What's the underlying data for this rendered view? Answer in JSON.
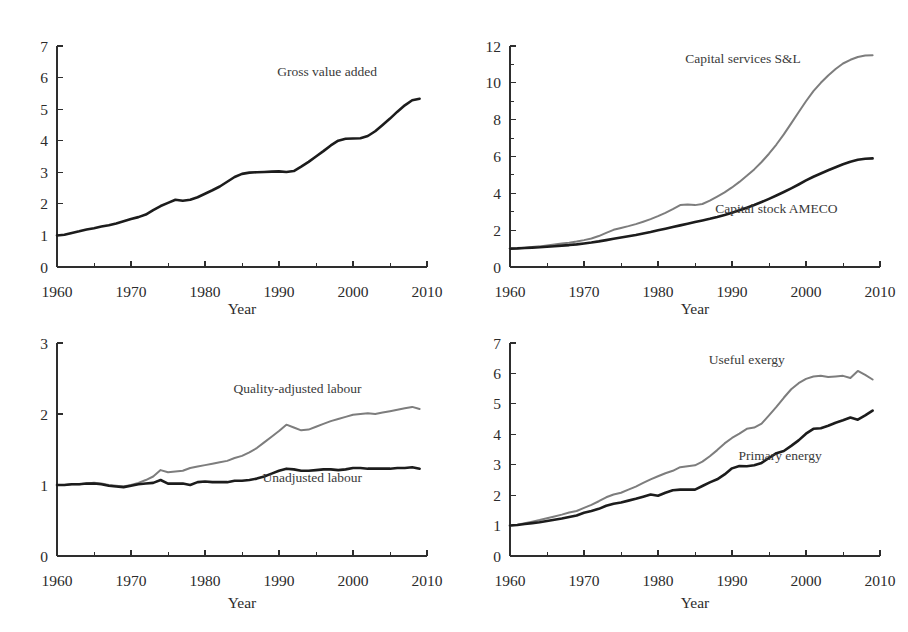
{
  "figure": {
    "title": "",
    "background": "#ffffff",
    "layout": "2x2 grid of line charts",
    "panel_count": 4
  },
  "colors": {
    "dark_series": "#1c1c1c",
    "grey_series": "#7d7d7d",
    "axis": "#2e2e2e",
    "text": "#2b2b2b",
    "background": "#ffffff"
  },
  "chart_data": [
    {
      "id": "panel-top-left",
      "type": "line",
      "title": "",
      "xlabel": "Year",
      "ylabel": "",
      "xlim": [
        1960,
        2010
      ],
      "ylim": [
        0,
        7
      ],
      "xticks": [
        1960,
        1970,
        1980,
        1990,
        2000,
        2010
      ],
      "xticklabels": [
        "1960",
        "1970",
        "1980",
        "1990",
        "2000",
        "2010"
      ],
      "xminorticks": [
        1965,
        1975,
        1985,
        1995,
        2005
      ],
      "yticks": [
        0,
        1,
        2,
        3,
        4,
        5,
        6,
        7
      ],
      "yticklabels": [
        "0",
        "1",
        "2",
        "3",
        "4",
        "5",
        "6",
        "7"
      ],
      "yminorticks": [],
      "grid": false,
      "legend": "inline-annotation",
      "annotations": [
        {
          "text": "Gross value added",
          "x": 1996.5,
          "y": 6.05,
          "anchor": "middle"
        }
      ],
      "series": [
        {
          "name": "Gross value added",
          "color": "#1c1c1c",
          "x": [
            1960,
            1961,
            1962,
            1963,
            1964,
            1965,
            1966,
            1967,
            1968,
            1969,
            1970,
            1971,
            1972,
            1973,
            1974,
            1975,
            1976,
            1977,
            1978,
            1979,
            1980,
            1981,
            1982,
            1983,
            1984,
            1985,
            1986,
            1987,
            1988,
            1989,
            1990,
            1991,
            1992,
            1993,
            1994,
            1995,
            1996,
            1997,
            1998,
            1999,
            2000,
            2001,
            2002,
            2003,
            2004,
            2005,
            2006,
            2007,
            2008,
            2009
          ],
          "values": [
            1.0,
            1.02,
            1.08,
            1.13,
            1.19,
            1.23,
            1.28,
            1.32,
            1.38,
            1.45,
            1.52,
            1.58,
            1.66,
            1.8,
            1.93,
            2.03,
            2.13,
            2.1,
            2.13,
            2.21,
            2.32,
            2.43,
            2.55,
            2.7,
            2.85,
            2.95,
            2.99,
            3.0,
            3.01,
            3.02,
            3.03,
            3.01,
            3.04,
            3.18,
            3.33,
            3.5,
            3.67,
            3.85,
            4.0,
            4.06,
            4.07,
            4.08,
            4.15,
            4.3,
            4.5,
            4.7,
            4.92,
            5.12,
            5.28,
            5.33
          ]
        }
      ]
    },
    {
      "id": "panel-top-right",
      "type": "line",
      "title": "",
      "xlabel": "Year",
      "ylabel": "",
      "xlim": [
        1960,
        2010
      ],
      "ylim": [
        0,
        12
      ],
      "xticks": [
        1960,
        1970,
        1980,
        1990,
        2000,
        2010
      ],
      "xticklabels": [
        "1960",
        "1970",
        "1980",
        "1990",
        "2000",
        "2010"
      ],
      "xminorticks": [
        1965,
        1975,
        1985,
        1995,
        2005
      ],
      "yticks": [
        0,
        2,
        4,
        6,
        8,
        10,
        12
      ],
      "yticklabels": [
        "0",
        "2",
        "4",
        "6",
        "8",
        "10",
        "12"
      ],
      "yminorticks": [
        1,
        3,
        5,
        7,
        9,
        11
      ],
      "grid": false,
      "legend": "inline-annotation",
      "annotations": [
        {
          "text": "Capital services S&L",
          "x": 1991.5,
          "y": 11.1,
          "anchor": "middle"
        },
        {
          "text": "Capital stock AMECO",
          "x": 1996.0,
          "y": 2.95,
          "anchor": "middle"
        }
      ],
      "series": [
        {
          "name": "Capital services S&L",
          "color": "#7d7d7d",
          "x": [
            1960,
            1961,
            1962,
            1963,
            1964,
            1965,
            1966,
            1967,
            1968,
            1969,
            1970,
            1971,
            1972,
            1973,
            1974,
            1975,
            1976,
            1977,
            1978,
            1979,
            1980,
            1981,
            1982,
            1983,
            1984,
            1985,
            1986,
            1987,
            1988,
            1989,
            1990,
            1991,
            1992,
            1993,
            1994,
            1995,
            1996,
            1997,
            1998,
            1999,
            2000,
            2001,
            2002,
            2003,
            2004,
            2005,
            2006,
            2007,
            2008,
            2009
          ],
          "values": [
            1.0,
            1.02,
            1.05,
            1.08,
            1.12,
            1.17,
            1.22,
            1.27,
            1.32,
            1.38,
            1.46,
            1.55,
            1.68,
            1.85,
            2.02,
            2.12,
            2.22,
            2.33,
            2.46,
            2.6,
            2.76,
            2.94,
            3.14,
            3.36,
            3.4,
            3.36,
            3.42,
            3.6,
            3.82,
            4.05,
            4.32,
            4.62,
            4.95,
            5.3,
            5.7,
            6.15,
            6.65,
            7.2,
            7.8,
            8.4,
            9.0,
            9.55,
            10.0,
            10.4,
            10.75,
            11.05,
            11.25,
            11.4,
            11.48,
            11.5
          ]
        },
        {
          "name": "Capital stock AMECO",
          "color": "#1c1c1c",
          "x": [
            1960,
            1961,
            1962,
            1963,
            1964,
            1965,
            1966,
            1967,
            1968,
            1969,
            1970,
            1971,
            1972,
            1973,
            1974,
            1975,
            1976,
            1977,
            1978,
            1979,
            1980,
            1981,
            1982,
            1983,
            1984,
            1985,
            1986,
            1987,
            1988,
            1989,
            1990,
            1991,
            1992,
            1993,
            1994,
            1995,
            1996,
            1997,
            1998,
            1999,
            2000,
            2001,
            2002,
            2003,
            2004,
            2005,
            2006,
            2007,
            2008,
            2009
          ],
          "values": [
            1.0,
            1.01,
            1.03,
            1.05,
            1.07,
            1.1,
            1.13,
            1.16,
            1.19,
            1.23,
            1.28,
            1.33,
            1.39,
            1.46,
            1.53,
            1.6,
            1.67,
            1.74,
            1.82,
            1.9,
            1.99,
            2.08,
            2.17,
            2.26,
            2.35,
            2.44,
            2.53,
            2.62,
            2.72,
            2.83,
            2.95,
            3.08,
            3.22,
            3.37,
            3.53,
            3.7,
            3.88,
            4.07,
            4.27,
            4.48,
            4.7,
            4.9,
            5.08,
            5.25,
            5.42,
            5.58,
            5.72,
            5.82,
            5.88,
            5.9
          ]
        }
      ]
    },
    {
      "id": "panel-bottom-left",
      "type": "line",
      "title": "",
      "xlabel": "Year",
      "ylabel": "",
      "xlim": [
        1960,
        2010
      ],
      "ylim": [
        0,
        3
      ],
      "xticks": [
        1960,
        1970,
        1980,
        1990,
        2000,
        2010
      ],
      "xticklabels": [
        "1960",
        "1970",
        "1980",
        "1990",
        "2000",
        "2010"
      ],
      "xminorticks": [
        1965,
        1975,
        1985,
        1995,
        2005
      ],
      "yticks": [
        0,
        1,
        2,
        3
      ],
      "yticklabels": [
        "0",
        "1",
        "2",
        "3"
      ],
      "yminorticks": [],
      "grid": false,
      "legend": "inline-annotation",
      "annotations": [
        {
          "text": "Quality-adjusted labour",
          "x": 1992.5,
          "y": 2.3,
          "anchor": "middle"
        },
        {
          "text": "Unadjusted labour",
          "x": 1994.5,
          "y": 1.04,
          "anchor": "middle"
        }
      ],
      "series": [
        {
          "name": "Quality-adjusted labour",
          "color": "#7d7d7d",
          "x": [
            1960,
            1961,
            1962,
            1963,
            1964,
            1965,
            1966,
            1967,
            1968,
            1969,
            1970,
            1971,
            1972,
            1973,
            1974,
            1975,
            1976,
            1977,
            1978,
            1979,
            1980,
            1981,
            1982,
            1983,
            1984,
            1985,
            1986,
            1987,
            1988,
            1989,
            1990,
            1991,
            1992,
            1993,
            1994,
            1995,
            1996,
            1997,
            1998,
            1999,
            2000,
            2001,
            2002,
            2003,
            2004,
            2005,
            2006,
            2007,
            2008,
            2009
          ],
          "values": [
            1.0,
            1.0,
            1.01,
            1.01,
            1.02,
            1.03,
            1.02,
            1.0,
            0.99,
            0.98,
            1.0,
            1.03,
            1.07,
            1.12,
            1.21,
            1.18,
            1.19,
            1.2,
            1.24,
            1.26,
            1.28,
            1.3,
            1.32,
            1.34,
            1.38,
            1.41,
            1.46,
            1.52,
            1.6,
            1.68,
            1.76,
            1.85,
            1.81,
            1.77,
            1.78,
            1.82,
            1.86,
            1.9,
            1.93,
            1.96,
            1.99,
            2.0,
            2.01,
            2.0,
            2.02,
            2.04,
            2.06,
            2.08,
            2.1,
            2.07
          ]
        },
        {
          "name": "Unadjusted labour",
          "color": "#1c1c1c",
          "x": [
            1960,
            1961,
            1962,
            1963,
            1964,
            1965,
            1966,
            1967,
            1968,
            1969,
            1970,
            1971,
            1972,
            1973,
            1974,
            1975,
            1976,
            1977,
            1978,
            1979,
            1980,
            1981,
            1982,
            1983,
            1984,
            1985,
            1986,
            1987,
            1988,
            1989,
            1990,
            1991,
            1992,
            1993,
            1994,
            1995,
            1996,
            1997,
            1998,
            1999,
            2000,
            2001,
            2002,
            2003,
            2004,
            2005,
            2006,
            2007,
            2008,
            2009
          ],
          "values": [
            1.0,
            1.0,
            1.01,
            1.01,
            1.02,
            1.02,
            1.01,
            0.99,
            0.98,
            0.97,
            0.99,
            1.01,
            1.02,
            1.03,
            1.07,
            1.02,
            1.02,
            1.02,
            1.0,
            1.04,
            1.05,
            1.04,
            1.04,
            1.04,
            1.06,
            1.06,
            1.07,
            1.09,
            1.12,
            1.16,
            1.2,
            1.23,
            1.22,
            1.2,
            1.2,
            1.21,
            1.22,
            1.22,
            1.21,
            1.22,
            1.24,
            1.24,
            1.23,
            1.23,
            1.23,
            1.23,
            1.24,
            1.24,
            1.25,
            1.23
          ]
        }
      ]
    },
    {
      "id": "panel-bottom-right",
      "type": "line",
      "title": "",
      "xlabel": "Year",
      "ylabel": "",
      "xlim": [
        1960,
        2010
      ],
      "ylim": [
        0,
        7
      ],
      "xticks": [
        1960,
        1970,
        1980,
        1990,
        2000,
        2010
      ],
      "xticklabels": [
        "1960",
        "1970",
        "1980",
        "1990",
        "2000",
        "2010"
      ],
      "xminorticks": [
        1965,
        1975,
        1985,
        1995,
        2005
      ],
      "yticks": [
        0,
        1,
        2,
        3,
        4,
        5,
        6,
        7
      ],
      "yticklabels": [
        "0",
        "1",
        "2",
        "3",
        "4",
        "5",
        "6",
        "7"
      ],
      "yminorticks": [],
      "grid": false,
      "legend": "inline-annotation",
      "annotations": [
        {
          "text": "Useful exergy",
          "x": 1992.0,
          "y": 6.3,
          "anchor": "middle"
        },
        {
          "text": "Primary energy",
          "x": 1996.5,
          "y": 3.15,
          "anchor": "middle"
        }
      ],
      "series": [
        {
          "name": "Useful exergy",
          "color": "#7d7d7d",
          "x": [
            1960,
            1961,
            1962,
            1963,
            1964,
            1965,
            1966,
            1967,
            1968,
            1969,
            1970,
            1971,
            1972,
            1973,
            1974,
            1975,
            1976,
            1977,
            1978,
            1979,
            1980,
            1981,
            1982,
            1983,
            1984,
            1985,
            1986,
            1987,
            1988,
            1989,
            1990,
            1991,
            1992,
            1993,
            1994,
            1995,
            1996,
            1997,
            1998,
            1999,
            2000,
            2001,
            2002,
            2003,
            2004,
            2005,
            2006,
            2007,
            2008,
            2009
          ],
          "values": [
            1.0,
            1.03,
            1.08,
            1.13,
            1.18,
            1.24,
            1.3,
            1.36,
            1.43,
            1.48,
            1.58,
            1.68,
            1.8,
            1.93,
            2.02,
            2.08,
            2.18,
            2.28,
            2.4,
            2.52,
            2.62,
            2.72,
            2.8,
            2.92,
            2.95,
            2.98,
            3.1,
            3.28,
            3.48,
            3.7,
            3.88,
            4.02,
            4.18,
            4.22,
            4.35,
            4.62,
            4.9,
            5.2,
            5.48,
            5.68,
            5.82,
            5.9,
            5.92,
            5.88,
            5.9,
            5.92,
            5.85,
            6.08,
            5.95,
            5.8
          ]
        },
        {
          "name": "Primary energy",
          "color": "#1c1c1c",
          "x": [
            1960,
            1961,
            1962,
            1963,
            1964,
            1965,
            1966,
            1967,
            1968,
            1969,
            1970,
            1971,
            1972,
            1973,
            1974,
            1975,
            1976,
            1977,
            1978,
            1979,
            1980,
            1981,
            1982,
            1983,
            1984,
            1985,
            1986,
            1987,
            1988,
            1989,
            1990,
            1991,
            1992,
            1993,
            1994,
            1995,
            1996,
            1997,
            1998,
            1999,
            2000,
            2001,
            2002,
            2003,
            2004,
            2005,
            2006,
            2007,
            2008,
            2009
          ],
          "values": [
            1.0,
            1.02,
            1.05,
            1.08,
            1.11,
            1.15,
            1.19,
            1.23,
            1.28,
            1.33,
            1.42,
            1.48,
            1.55,
            1.65,
            1.72,
            1.76,
            1.82,
            1.88,
            1.95,
            2.02,
            1.98,
            2.08,
            2.16,
            2.18,
            2.18,
            2.18,
            2.3,
            2.42,
            2.52,
            2.68,
            2.88,
            2.96,
            2.95,
            2.98,
            3.06,
            3.22,
            3.38,
            3.45,
            3.62,
            3.8,
            4.02,
            4.18,
            4.2,
            4.28,
            4.38,
            4.46,
            4.55,
            4.48,
            4.62,
            4.78
          ]
        }
      ]
    }
  ]
}
